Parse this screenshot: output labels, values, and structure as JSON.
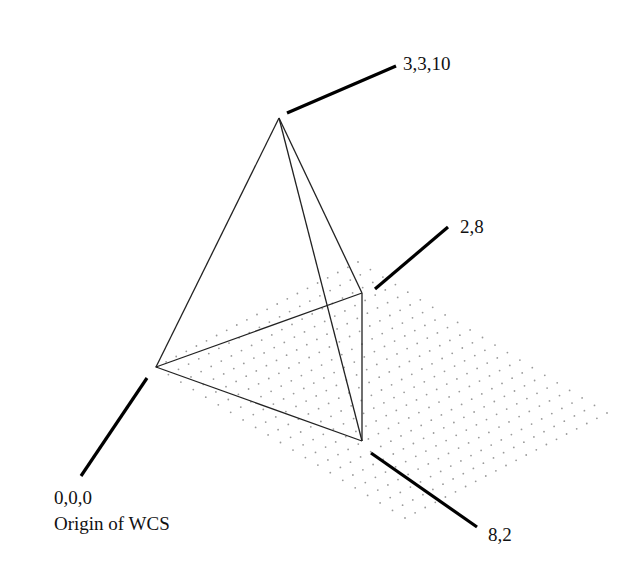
{
  "diagram": {
    "labels": {
      "apex": "3,3,10",
      "back_corner": "2,8",
      "front_corner": "8,2",
      "origin_coords": "0,0,0",
      "origin_caption": "Origin of WCS"
    },
    "vertices_px": {
      "origin": [
        156,
        367
      ],
      "apex": [
        279,
        118
      ],
      "back_corner": [
        362,
        293
      ],
      "front_corner": [
        362,
        441
      ]
    },
    "grid": {
      "corners_px": {
        "left": [
          156,
          367
        ],
        "top": [
          358,
          262
        ],
        "right": [
          598,
          405
        ],
        "bottom": [
          405,
          518
        ]
      },
      "rows": 20,
      "cols": 20,
      "dot_color": "#9a9a9a"
    },
    "leaders_px": [
      {
        "name": "apex-leader",
        "from": [
          287,
          113
        ],
        "to": [
          396,
          66
        ]
      },
      {
        "name": "back-corner-leader",
        "from": [
          375,
          289
        ],
        "to": [
          448,
          227
        ]
      },
      {
        "name": "front-corner-leader",
        "from": [
          371,
          453
        ],
        "to": [
          477,
          527
        ]
      },
      {
        "name": "origin-leader",
        "from": [
          147,
          378
        ],
        "to": [
          81,
          476
        ]
      }
    ]
  }
}
